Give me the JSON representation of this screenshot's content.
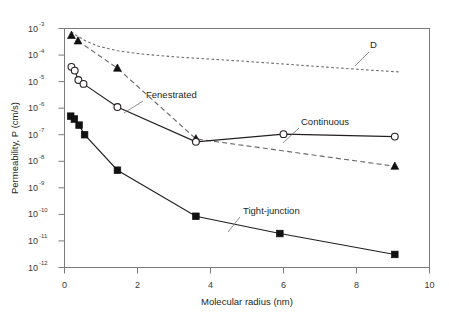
{
  "chart_data": {
    "type": "line",
    "title": "",
    "xlabel": "Molecular radius (nm)",
    "ylabel": "Permeability, P (cm/s)",
    "xlim": [
      0,
      10
    ],
    "ylim_log10": [
      -12,
      -3
    ],
    "xticks": [
      "0",
      "2",
      "4",
      "6",
      "8",
      "10"
    ],
    "xtick_values": [
      0,
      2,
      4,
      6,
      8,
      10
    ],
    "yticks": [
      {
        "mantissa": "10",
        "exponent": "-3"
      },
      {
        "mantissa": "10",
        "exponent": "-4"
      },
      {
        "mantissa": "10",
        "exponent": "-5"
      },
      {
        "mantissa": "10",
        "exponent": "-6"
      },
      {
        "mantissa": "10",
        "exponent": "-7"
      },
      {
        "mantissa": "10",
        "exponent": "-8"
      },
      {
        "mantissa": "10",
        "exponent": "-9"
      },
      {
        "mantissa": "10",
        "exponent": "-10"
      },
      {
        "mantissa": "10",
        "exponent": "-11"
      },
      {
        "mantissa": "10",
        "exponent": "-12"
      }
    ],
    "yscale": "log",
    "grid": false,
    "legend": "inline-annotations",
    "series": [
      {
        "name": "D",
        "label": "D",
        "style": "dotted",
        "marker": "none",
        "color": "#6b6b6b",
        "x": [
          0.18,
          0.35,
          0.55,
          0.9,
          1.45,
          2.1,
          3.0,
          3.6,
          4.8,
          6.0,
          7.2,
          8.2,
          9.2
        ],
        "y": [
          0.00075,
          0.00052,
          0.00036,
          0.00022,
          0.000145,
          0.00011,
          8.6e-05,
          7.6e-05,
          6e-05,
          4.6e-05,
          3.5e-05,
          2.8e-05,
          2.3e-05
        ]
      },
      {
        "name": "Fenestrated",
        "label": "Fenestrated",
        "style": "dashed",
        "marker": "filled-triangle",
        "color": "#6b6b6b",
        "x": [
          0.19,
          0.37,
          1.45,
          3.6,
          9.05
        ],
        "y": [
          0.00055,
          0.00034,
          3.2e-05,
          7e-08,
          6.5e-09
        ]
      },
      {
        "name": "Continuous",
        "label": "Continuous",
        "style": "solid",
        "marker": "open-circle",
        "color": "#231f20",
        "x": [
          0.19,
          0.28,
          0.38,
          0.52,
          1.45,
          3.6,
          6.0,
          9.05
        ],
        "y": [
          3.6e-05,
          2.6e-05,
          1.15e-05,
          8.2e-06,
          1.1e-06,
          5.4e-08,
          1.05e-07,
          8.5e-08
        ]
      },
      {
        "name": "Tight-junction",
        "label": "Tight-junction",
        "style": "solid",
        "marker": "filled-square",
        "color": "#111111",
        "x": [
          0.17,
          0.27,
          0.4,
          0.55,
          1.45,
          3.6,
          5.9,
          9.05
        ],
        "y": [
          5e-07,
          3.9e-07,
          2.3e-07,
          1e-07,
          4.6e-09,
          8.5e-11,
          1.9e-11,
          3.1e-12
        ]
      }
    ],
    "annotations": [
      {
        "name": "D",
        "text": "D",
        "x_px": 370,
        "y_px": 47
      },
      {
        "name": "Fenestrated",
        "text": "Fenestrated",
        "x_px": 146,
        "y_px": 97
      },
      {
        "name": "Continuous",
        "text": "Continuous",
        "x_px": 300,
        "y_px": 124
      },
      {
        "name": "Tight-junction",
        "text": "Tight-junction",
        "x_px": 243,
        "y_px": 213
      }
    ]
  },
  "axes": {
    "x_title": "Molecular radius (nm)",
    "y_title": "Permeability, P (cm/s)"
  },
  "caption": {
    "text": ""
  }
}
